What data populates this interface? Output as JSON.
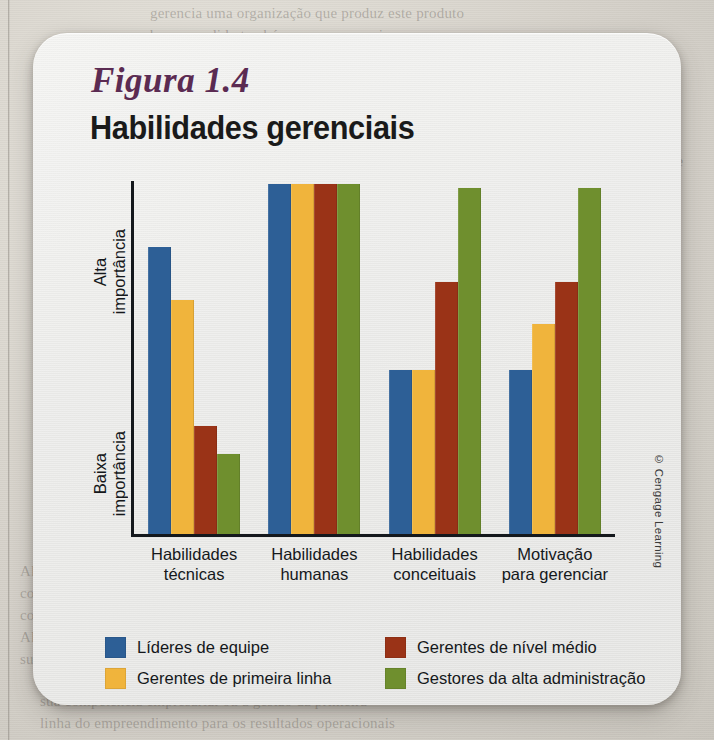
{
  "figure": {
    "label": "Figura 1.4",
    "title": "Habilidades gerenciais",
    "credit": "© Cengage Learning"
  },
  "axis": {
    "y_high_label": "Alta\nimportância",
    "y_low_label": "Baixa\nimportância"
  },
  "colors": {
    "series_blue": "#2d5f96",
    "series_yellow": "#f0b43c",
    "series_red": "#9a3317",
    "series_green": "#6f8f2e",
    "axis": "#14181c",
    "card_bg": "#eeeeec",
    "page_bg": "#d8d5cf",
    "label_purple": "#5b2b52",
    "text": "#15181b"
  },
  "legend": {
    "items": [
      {
        "label": "Líderes de equipe",
        "color": "#2d5f96"
      },
      {
        "label": "Gerentes de nível médio",
        "color": "#9a3317"
      },
      {
        "label": "Gerentes de primeira linha",
        "color": "#f0b43c"
      },
      {
        "label": "Gestores da alta administração",
        "color": "#6f8f2e"
      }
    ]
  },
  "ghost_page_text": {
    "top": "gerencia uma organização que produz este produto\nbem-sucedido também, ou que possui\nde enquanto não tiver a gestão\ntambém bem-feita. Portanto, a gestão",
    "right": "necessários não são quatro habilidades, basicamente\ndesde a competência de desenvolver a sua conduta\ndo processo de garantir\n\no papel de compreender todo o sistema\ntambém se veem atividades, decisões e resultados",
    "left": "Além disso, o gerente deve saber\nconquistar a equipe e manter\ncomo preparar e destacar\nAlém disso, considerado o segundo\nsua administração para os níveis",
    "bottom": "sua competência empresarial ou a gestão da primeira\nlinha do empreendimento para os resultados operacionais"
  },
  "chart_data": {
    "type": "bar",
    "title": "Habilidades gerenciais",
    "xlabel": "",
    "ylabel": "Importância",
    "ylim": [
      0,
      100
    ],
    "grid": false,
    "legend_position": "bottom",
    "categories": [
      "Habilidades\ntécnicas",
      "Habilidades\nhumanas",
      "Habilidades\nconceituais",
      "Motivação\npara gerenciar"
    ],
    "series": [
      {
        "name": "Líderes de equipe",
        "color": "#2d5f96",
        "values": [
          82,
          100,
          47,
          47
        ]
      },
      {
        "name": "Gerentes de primeira linha",
        "color": "#f0b43c",
        "values": [
          67,
          100,
          47,
          60
        ]
      },
      {
        "name": "Gerentes de nível médio",
        "color": "#9a3317",
        "values": [
          31,
          100,
          72,
          72
        ]
      },
      {
        "name": "Gestores da alta administração",
        "color": "#6f8f2e",
        "values": [
          23,
          100,
          99,
          99
        ]
      }
    ]
  }
}
